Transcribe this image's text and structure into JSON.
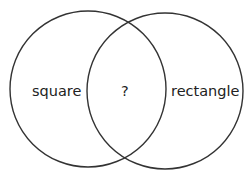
{
  "diagram": {
    "type": "venn",
    "sets": [
      {
        "label": "square",
        "cx": 88,
        "cy": 89,
        "r": 78
      },
      {
        "label": "rectangle",
        "cx": 165,
        "cy": 91,
        "r": 78
      }
    ],
    "intersection_label": "?",
    "stroke_color": "#333333"
  }
}
